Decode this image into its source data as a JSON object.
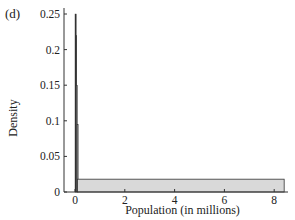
{
  "panel_label": "(d)",
  "chart_data": {
    "type": "bar",
    "title": "",
    "xlabel": "Population (in millions)",
    "ylabel": "Density",
    "xlim": [
      -0.4,
      8.6
    ],
    "ylim": [
      0,
      0.26
    ],
    "xticks": [
      0,
      2,
      4,
      6,
      8
    ],
    "yticks": [
      0,
      0.05,
      0.1,
      0.15,
      0.2,
      0.25
    ],
    "ytick_labels": [
      "0",
      "0.05",
      "0.1",
      "0.15",
      "0.2",
      "0.25"
    ],
    "grid": false,
    "legend": null,
    "bins": [
      {
        "x_start": 0.0,
        "x_end": 0.02,
        "density": 0.25
      },
      {
        "x_start": 0.02,
        "x_end": 0.05,
        "density": 0.22
      },
      {
        "x_start": 0.05,
        "x_end": 0.08,
        "density": 0.15
      },
      {
        "x_start": 0.08,
        "x_end": 0.1,
        "density": 0.095
      },
      {
        "x_start": 0.1,
        "x_end": 8.4,
        "density": 0.018
      }
    ],
    "colors": {
      "bar_fill": "#d9d9d9",
      "spike_fill": "#333333",
      "axis": "#333333"
    }
  }
}
